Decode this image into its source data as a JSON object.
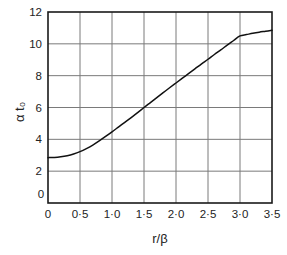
{
  "chart_data": {
    "type": "line",
    "title": "",
    "xlabel": "r/β",
    "ylabel": "α t₀",
    "xlim": [
      0,
      3.5
    ],
    "ylim": [
      0,
      12
    ],
    "grid": true,
    "legend": false,
    "legend_position": "none",
    "x_tick_labels": [
      "0",
      "0·5",
      "1·0",
      "1·5",
      "2·0",
      "2·5",
      "3·0",
      "3·5"
    ],
    "x_tick_values": [
      0,
      0.5,
      1.0,
      1.5,
      2.0,
      2.5,
      3.0,
      3.5
    ],
    "y_tick_labels": [
      "0",
      "2",
      "4",
      "6",
      "8",
      "10",
      "12"
    ],
    "y_tick_values": [
      0,
      2,
      4,
      6,
      8,
      10,
      12
    ],
    "x": [
      0.0,
      0.1,
      0.2,
      0.3,
      0.4,
      0.5,
      0.6,
      0.7,
      0.8,
      0.9,
      1.0,
      1.1,
      1.2,
      1.3,
      1.4,
      1.5,
      1.6,
      1.7,
      1.8,
      1.9,
      2.0,
      2.1,
      2.2,
      2.3,
      2.4,
      2.5,
      2.6,
      2.7,
      2.8,
      2.9,
      3.0,
      3.1,
      3.2,
      3.3,
      3.4,
      3.5
    ],
    "y": [
      2.85,
      2.86,
      2.9,
      2.97,
      3.08,
      3.23,
      3.42,
      3.64,
      3.9,
      4.18,
      4.47,
      4.77,
      5.07,
      5.37,
      5.68,
      6.0,
      6.31,
      6.62,
      6.93,
      7.24,
      7.54,
      7.84,
      8.14,
      8.44,
      8.74,
      9.03,
      9.33,
      9.62,
      9.92,
      10.21,
      10.5,
      10.58,
      10.66,
      10.73,
      10.79,
      10.85
    ],
    "series": [
      {
        "name": "α t₀ vs r/β",
        "color": "#111111",
        "values": [
          2.85,
          2.86,
          2.9,
          2.97,
          3.08,
          3.23,
          3.42,
          3.64,
          3.9,
          4.18,
          4.47,
          4.77,
          5.07,
          5.37,
          5.68,
          6.0,
          6.31,
          6.62,
          6.93,
          7.24,
          7.54,
          7.84,
          8.14,
          8.44,
          8.74,
          9.03,
          9.33,
          9.62,
          9.92,
          10.21,
          10.5,
          10.58,
          10.66,
          10.73,
          10.79,
          10.85
        ]
      }
    ],
    "annotations": [],
    "colors": {
      "curve": "#111111",
      "frame": "#1a1a1a",
      "grid": "#7a7a7a",
      "background": "#ffffff",
      "text": "#232323"
    }
  }
}
